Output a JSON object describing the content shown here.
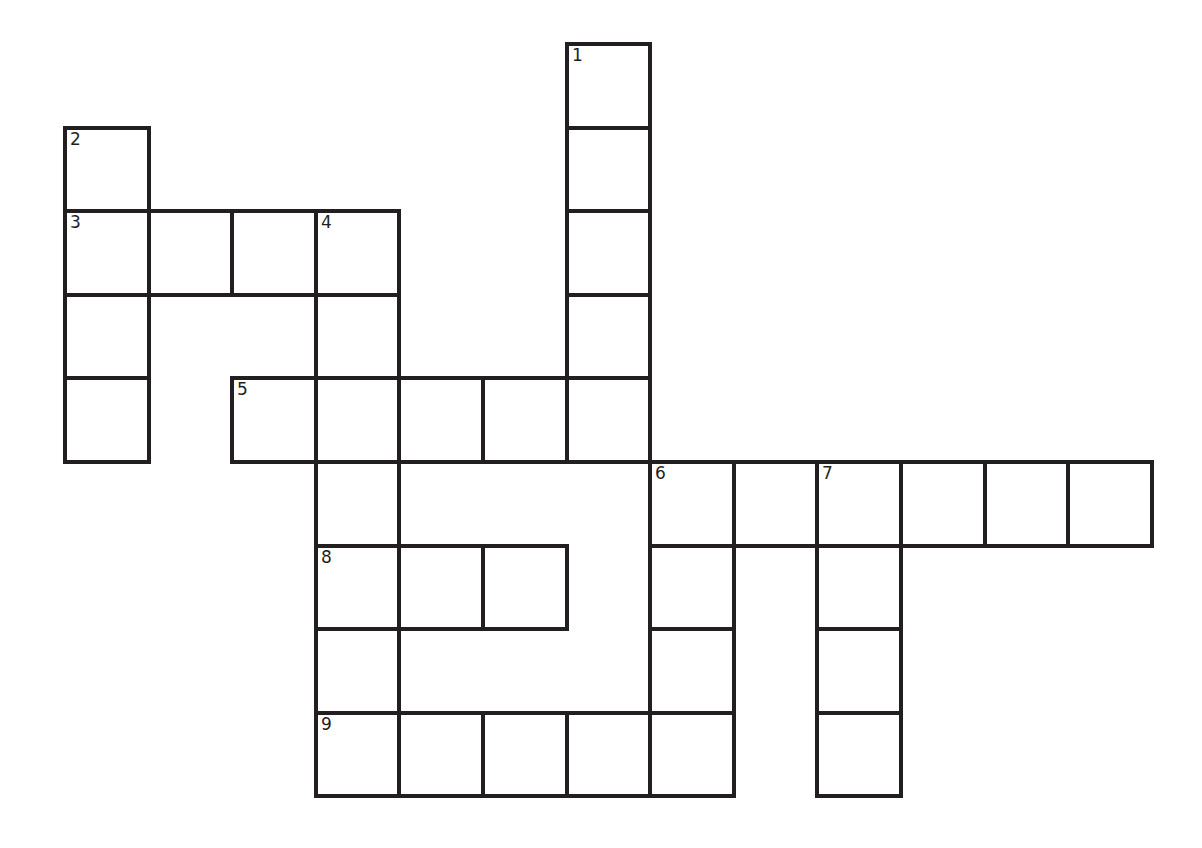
{
  "puzzle": {
    "type": "crossword",
    "grid": {
      "origin_x": 63,
      "origin_y": 42,
      "cell_size": 83.6,
      "border_color": "#231f20",
      "background": "#ffffff"
    },
    "cells": [
      {
        "r": 0,
        "c": 6,
        "n": "1"
      },
      {
        "r": 1,
        "c": 0,
        "n": "2"
      },
      {
        "r": 1,
        "c": 6
      },
      {
        "r": 2,
        "c": 0,
        "n": "3"
      },
      {
        "r": 2,
        "c": 1
      },
      {
        "r": 2,
        "c": 2
      },
      {
        "r": 2,
        "c": 3,
        "n": "4"
      },
      {
        "r": 2,
        "c": 6
      },
      {
        "r": 3,
        "c": 0
      },
      {
        "r": 3,
        "c": 3
      },
      {
        "r": 3,
        "c": 6
      },
      {
        "r": 4,
        "c": 0
      },
      {
        "r": 4,
        "c": 2,
        "n": "5"
      },
      {
        "r": 4,
        "c": 3
      },
      {
        "r": 4,
        "c": 4
      },
      {
        "r": 4,
        "c": 5
      },
      {
        "r": 4,
        "c": 6
      },
      {
        "r": 5,
        "c": 3
      },
      {
        "r": 5,
        "c": 7,
        "n": "6"
      },
      {
        "r": 5,
        "c": 8
      },
      {
        "r": 5,
        "c": 9,
        "n": "7"
      },
      {
        "r": 5,
        "c": 10
      },
      {
        "r": 5,
        "c": 11
      },
      {
        "r": 5,
        "c": 12
      },
      {
        "r": 6,
        "c": 3,
        "n": "8"
      },
      {
        "r": 6,
        "c": 4
      },
      {
        "r": 6,
        "c": 5
      },
      {
        "r": 6,
        "c": 7
      },
      {
        "r": 6,
        "c": 9
      },
      {
        "r": 7,
        "c": 3
      },
      {
        "r": 7,
        "c": 7
      },
      {
        "r": 7,
        "c": 9
      },
      {
        "r": 8,
        "c": 3,
        "n": "9"
      },
      {
        "r": 8,
        "c": 4
      },
      {
        "r": 8,
        "c": 5
      },
      {
        "r": 8,
        "c": 6
      },
      {
        "r": 8,
        "c": 7
      },
      {
        "r": 8,
        "c": 9
      }
    ],
    "entries": {
      "across": [
        {
          "number": "3",
          "length": 4
        },
        {
          "number": "5",
          "length": 5
        },
        {
          "number": "6",
          "length": 6
        },
        {
          "number": "8",
          "length": 3
        },
        {
          "number": "9",
          "length": 5
        }
      ],
      "down": [
        {
          "number": "1",
          "length": 5
        },
        {
          "number": "2",
          "length": 4
        },
        {
          "number": "4",
          "length": 7
        },
        {
          "number": "6",
          "length": 4
        },
        {
          "number": "7",
          "length": 4
        }
      ]
    }
  }
}
